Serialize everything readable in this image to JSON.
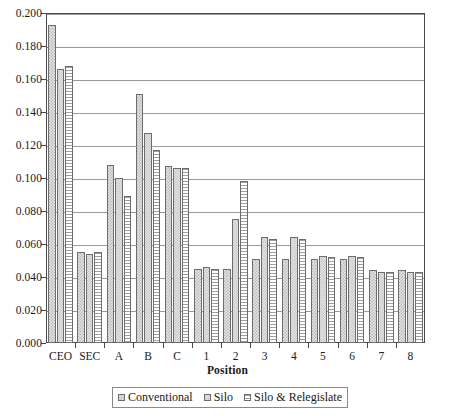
{
  "chart_data": {
    "type": "bar",
    "title": "",
    "xlabel": "Position",
    "ylabel": "",
    "ylim": [
      0.0,
      0.2
    ],
    "ytick_step": 0.02,
    "grid": true,
    "legend_position": "bottom",
    "categories": [
      "CEO",
      "SEC",
      "A",
      "B",
      "C",
      "1",
      "2",
      "3",
      "4",
      "5",
      "6",
      "7",
      "8"
    ],
    "ytick_labels": [
      "0.000",
      "0.020",
      "0.040",
      "0.060",
      "0.080",
      "0.100",
      "0.120",
      "0.140",
      "0.160",
      "0.180",
      "0.200"
    ],
    "series": [
      {
        "name": "Conventional",
        "values": [
          0.193,
          0.055,
          0.108,
          0.151,
          0.107,
          0.045,
          0.045,
          0.051,
          0.051,
          0.051,
          0.051,
          0.044,
          0.044
        ]
      },
      {
        "name": "Silo",
        "values": [
          0.166,
          0.054,
          0.1,
          0.127,
          0.106,
          0.046,
          0.075,
          0.064,
          0.064,
          0.053,
          0.053,
          0.043,
          0.043
        ]
      },
      {
        "name": "Silo & Relegislate",
        "values": [
          0.168,
          0.055,
          0.089,
          0.117,
          0.106,
          0.045,
          0.098,
          0.063,
          0.063,
          0.052,
          0.052,
          0.043,
          0.043
        ]
      }
    ]
  },
  "colors": {
    "axis": "#4a4a4a",
    "gridline": "#9a9a9a",
    "bar_outline": "#6d6d6d",
    "background": "#ffffff",
    "text": "#1a1a1a"
  }
}
